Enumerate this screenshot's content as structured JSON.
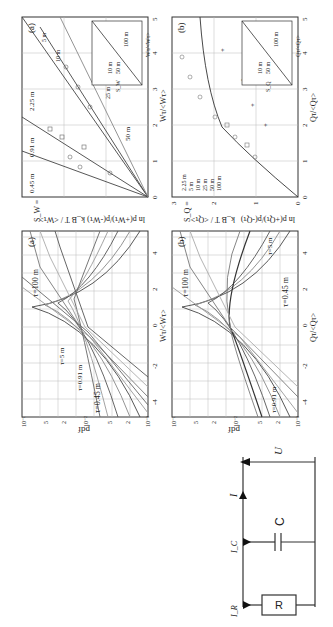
{
  "figure": {
    "circuit": {
      "resistor_label": "R",
      "capacitor_label": "C",
      "voltage_label": "U",
      "current_total": "I",
      "current_R": "I_R",
      "current_C": "I_C"
    },
    "panel_pdf_a": {
      "tag": "(a)",
      "ylabel": "pdf",
      "xlabel": "Wτ/<Wτ>",
      "yticks": [
        "10⁻³",
        "2",
        "5",
        "10⁻²",
        "2",
        "5",
        "10⁻¹"
      ],
      "xticks": [
        "-4",
        "-2",
        "0",
        "2",
        "4"
      ],
      "annotations": [
        "τ=100 m",
        "τ=5 m",
        "τ=0.91 m",
        "τ=0.45 m"
      ]
    },
    "panel_pdf_b": {
      "tag": "(b)",
      "ylabel": "pdf",
      "xlabel": "Qτ/<Qτ>",
      "yticks": [
        "10⁻³",
        "2",
        "5",
        "10⁻²",
        "2",
        "5",
        "10⁻¹"
      ],
      "xticks": [
        "-4",
        "-2",
        "0",
        "2",
        "4"
      ],
      "annotations": [
        "τ=100 m",
        "τ=5 m",
        "τ=0.91 m",
        "τ=0.45 m"
      ]
    },
    "panel_S_a": {
      "tag": "(a)",
      "formula_lhs": "S_W =",
      "formula_frac": "k_B T / <Wτ>",
      "formula_ln": "ln p(+Wτ)/p(-Wτ)",
      "xlabel": "Wτ/<Wτ>",
      "xticks": [
        "0",
        "1",
        "2",
        "3",
        "4",
        "5"
      ],
      "annotations": [
        "0.45 m",
        "0.91 m",
        "2.25 m",
        "5 m",
        "10 m",
        "25 m",
        "50 m"
      ],
      "inset": {
        "ylabel": "S_W",
        "xlabel": "Wτ/<Wτ>",
        "x0": "0",
        "x1": "1",
        "y1": "1",
        "legend": [
          "10 m",
          "50 m",
          "100 m"
        ]
      }
    },
    "panel_S_b": {
      "tag": "(b)",
      "formula_lhs": "S_Q =",
      "formula_frac": "k_B T / <Qτ>",
      "formula_ln": "ln p(+Qτ)/p(-Qτ)",
      "xlabel": "Qτ/<Qτ>",
      "xticks": [
        "0",
        "1",
        "2",
        "3",
        "4",
        "5"
      ],
      "yticks": [
        "0",
        "1",
        "2",
        "3"
      ],
      "legend": [
        "2.25 m",
        "5 m",
        "10 m",
        "25 m",
        "50 m",
        "100 m"
      ],
      "legend_markers": [
        "+",
        "○",
        "⊞",
        "△",
        "×",
        "□"
      ],
      "inset": {
        "ylabel": "S_Q",
        "xlabel": "Qτ/<Qτ>",
        "x0": "0",
        "x1": "1",
        "y1": "1",
        "legend": [
          "10 m",
          "50 m",
          "100 m"
        ]
      }
    }
  }
}
